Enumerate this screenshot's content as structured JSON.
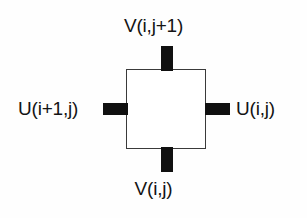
{
  "diagram": {
    "colors": {
      "background": "#fefefe",
      "cell_fill": "#ffffff",
      "cell_border": "#3a3a3a",
      "flux_bar": "#101010",
      "label_text": "#141414"
    },
    "cell": {
      "name": "control-volume"
    },
    "faces": [
      {
        "id": "top",
        "label": "V(i,j+1)",
        "quantity": "V",
        "indices": "i,j+1",
        "bar_name": "flux-bar-top"
      },
      {
        "id": "bottom",
        "label": "V(i,j)",
        "quantity": "V",
        "indices": "i,j",
        "bar_name": "flux-bar-bottom"
      },
      {
        "id": "left",
        "label": "U(i+1,j)",
        "quantity": "U",
        "indices": "i+1,j",
        "bar_name": "flux-bar-left"
      },
      {
        "id": "right",
        "label": "U(i,j)",
        "quantity": "U",
        "indices": "i,j",
        "bar_name": "flux-bar-right"
      }
    ]
  }
}
